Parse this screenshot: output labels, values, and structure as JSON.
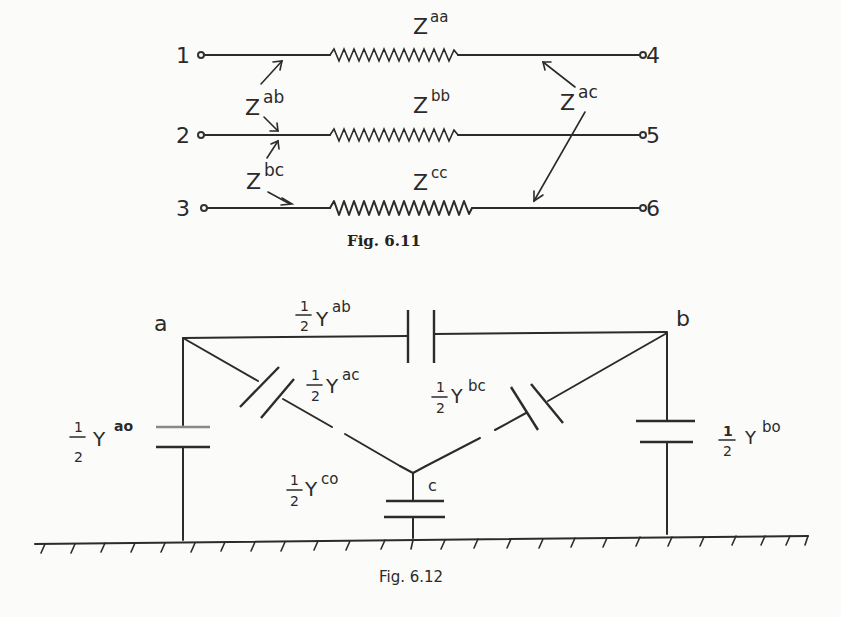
{
  "figures": [
    {
      "caption": "Fig. 6.11",
      "terminals": {
        "t1": "1",
        "t2": "2",
        "t3": "3",
        "t4": "4",
        "t5": "5",
        "t6": "6"
      },
      "impedances": {
        "aa": {
          "base": "Z",
          "sup": "aa"
        },
        "bb": {
          "base": "Z",
          "sup": "bb"
        },
        "cc": {
          "base": "Z",
          "sup": "cc"
        },
        "ab": {
          "base": "Z",
          "sup": "ab"
        },
        "bc": {
          "base": "Z",
          "sup": "bc"
        },
        "ac": {
          "base": "Z",
          "sup": "ac"
        }
      }
    },
    {
      "caption": "Fig. 6.12",
      "nodes": {
        "a": "a",
        "b": "b",
        "c": "c"
      },
      "fraction": {
        "num": "1",
        "den": "2"
      },
      "admittances": {
        "ab": {
          "base": "Y",
          "sup": "ab"
        },
        "ac": {
          "base": "Y",
          "sup": "ac"
        },
        "bc": {
          "base": "Y",
          "sup": "bc"
        },
        "ao": {
          "base": "Y",
          "sup": "ao"
        },
        "bo": {
          "base": "Y",
          "sup": "bo"
        },
        "co": {
          "base": "Y",
          "sup": "co"
        }
      }
    }
  ]
}
